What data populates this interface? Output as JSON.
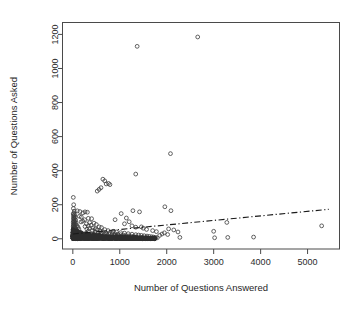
{
  "chart_data": {
    "type": "scatter",
    "title": "",
    "xlabel": "Number of Questions Answered",
    "ylabel": "Number of Questions Asked",
    "xlim": [
      -220,
      5680
    ],
    "ylim": [
      -60,
      1270
    ],
    "xticks": [
      0,
      1000,
      2000,
      3000,
      4000,
      5000
    ],
    "yticks": [
      0,
      200,
      400,
      600,
      800,
      1000,
      1200
    ],
    "xtick_labels": [
      "0",
      "1000",
      "2000",
      "3000",
      "4000",
      "5000"
    ],
    "ytick_labels": [
      "0",
      "200",
      "400",
      "600",
      "800",
      "1000",
      "1200"
    ],
    "grid": false,
    "legend": null,
    "marker": "open-circle",
    "point_color": "#3b3b3b",
    "line_color": "#1a1a1a",
    "box_color": "#4a4a4a",
    "background": "#ffffff",
    "series": [
      {
        "name": "users",
        "points": [
          [
            10,
            243
          ],
          [
            18,
            200
          ],
          [
            12,
            178
          ],
          [
            30,
            162
          ],
          [
            22,
            150
          ],
          [
            8,
            146
          ],
          [
            40,
            141
          ],
          [
            15,
            136
          ],
          [
            26,
            130
          ],
          [
            52,
            126
          ],
          [
            12,
            122
          ],
          [
            35,
            118
          ],
          [
            20,
            114
          ],
          [
            60,
            110
          ],
          [
            14,
            106
          ],
          [
            28,
            102
          ],
          [
            45,
            99
          ],
          [
            10,
            96
          ],
          [
            70,
            93
          ],
          [
            18,
            90
          ],
          [
            33,
            87
          ],
          [
            55,
            84
          ],
          [
            12,
            82
          ],
          [
            25,
            79
          ],
          [
            90,
            77
          ],
          [
            16,
            75
          ],
          [
            42,
            72
          ],
          [
            8,
            70
          ],
          [
            110,
            68
          ],
          [
            30,
            66
          ],
          [
            62,
            64
          ],
          [
            14,
            62
          ],
          [
            38,
            60
          ],
          [
            20,
            58
          ],
          [
            130,
            57
          ],
          [
            10,
            55
          ],
          [
            48,
            54
          ],
          [
            24,
            52
          ],
          [
            75,
            51
          ],
          [
            16,
            50
          ],
          [
            36,
            48
          ],
          [
            12,
            47
          ],
          [
            95,
            46
          ],
          [
            28,
            45
          ],
          [
            58,
            44
          ],
          [
            18,
            43
          ],
          [
            44,
            42
          ],
          [
            10,
            41
          ],
          [
            140,
            40
          ],
          [
            32,
            39
          ],
          [
            68,
            38
          ],
          [
            22,
            37
          ],
          [
            50,
            36
          ],
          [
            14,
            35
          ],
          [
            115,
            34
          ],
          [
            26,
            34
          ],
          [
            80,
            33
          ],
          [
            16,
            32
          ],
          [
            40,
            31
          ],
          [
            12,
            31
          ],
          [
            160,
            30
          ],
          [
            30,
            29
          ],
          [
            60,
            29
          ],
          [
            20,
            28
          ],
          [
            100,
            27
          ],
          [
            14,
            27
          ],
          [
            46,
            26
          ],
          [
            24,
            26
          ],
          [
            130,
            25
          ],
          [
            18,
            25
          ],
          [
            70,
            24
          ],
          [
            34,
            24
          ],
          [
            10,
            23
          ],
          [
            190,
            23
          ],
          [
            52,
            22
          ],
          [
            28,
            22
          ],
          [
            88,
            21
          ],
          [
            16,
            21
          ],
          [
            42,
            20
          ],
          [
            22,
            20
          ],
          [
            150,
            19
          ],
          [
            12,
            19
          ],
          [
            64,
            18
          ],
          [
            32,
            18
          ],
          [
            105,
            17
          ],
          [
            18,
            17
          ],
          [
            48,
            16
          ],
          [
            26,
            16
          ],
          [
            220,
            15
          ],
          [
            14,
            15
          ],
          [
            76,
            14
          ],
          [
            36,
            14
          ],
          [
            120,
            13
          ],
          [
            20,
            13
          ],
          [
            56,
            12
          ],
          [
            30,
            12
          ],
          [
            170,
            11
          ],
          [
            16,
            11
          ],
          [
            92,
            10
          ],
          [
            40,
            10
          ],
          [
            250,
            9
          ],
          [
            24,
            9
          ],
          [
            68,
            8
          ],
          [
            34,
            8
          ],
          [
            140,
            7
          ],
          [
            18,
            7
          ],
          [
            84,
            6
          ],
          [
            44,
            6
          ],
          [
            200,
            5
          ],
          [
            22,
            5
          ],
          [
            110,
            4
          ],
          [
            52,
            4
          ],
          [
            300,
            3
          ],
          [
            28,
            3
          ],
          [
            72,
            2
          ],
          [
            38,
            2
          ],
          [
            160,
            1
          ],
          [
            12,
            1
          ],
          [
            96,
            0
          ],
          [
            48,
            0
          ],
          [
            260,
            158
          ],
          [
            150,
            160
          ],
          [
            215,
            152
          ],
          [
            310,
            156
          ],
          [
            95,
            164
          ],
          [
            330,
            120
          ],
          [
            180,
            128
          ],
          [
            250,
            112
          ],
          [
            400,
            118
          ],
          [
            140,
            132
          ],
          [
            360,
            95
          ],
          [
            210,
            104
          ],
          [
            290,
            88
          ],
          [
            450,
            92
          ],
          [
            175,
            99
          ],
          [
            500,
            84
          ],
          [
            330,
            76
          ],
          [
            390,
            80
          ],
          [
            260,
            72
          ],
          [
            560,
            70
          ],
          [
            430,
            64
          ],
          [
            610,
            66
          ],
          [
            350,
            60
          ],
          [
            480,
            58
          ],
          [
            300,
            56
          ],
          [
            680,
            54
          ],
          [
            520,
            52
          ],
          [
            420,
            50
          ],
          [
            750,
            48
          ],
          [
            580,
            46
          ],
          [
            330,
            45
          ],
          [
            860,
            44
          ],
          [
            640,
            42
          ],
          [
            470,
            41
          ],
          [
            930,
            40
          ],
          [
            700,
            38
          ],
          [
            540,
            37
          ],
          [
            1020,
            36
          ],
          [
            780,
            35
          ],
          [
            610,
            34
          ],
          [
            1100,
            33
          ],
          [
            840,
            32
          ],
          [
            670,
            31
          ],
          [
            1180,
            30
          ],
          [
            900,
            29
          ],
          [
            720,
            28
          ],
          [
            1260,
            27
          ],
          [
            960,
            26
          ],
          [
            780,
            25
          ],
          [
            1340,
            24
          ],
          [
            1020,
            24
          ],
          [
            830,
            23
          ],
          [
            1400,
            22
          ],
          [
            1080,
            21
          ],
          [
            880,
            21
          ],
          [
            1460,
            20
          ],
          [
            1140,
            19
          ],
          [
            930,
            19
          ],
          [
            1520,
            18
          ],
          [
            1200,
            17
          ],
          [
            980,
            17
          ],
          [
            1580,
            16
          ],
          [
            1250,
            15
          ],
          [
            1030,
            15
          ],
          [
            1630,
            14
          ],
          [
            1300,
            13
          ],
          [
            1080,
            13
          ],
          [
            1680,
            12
          ],
          [
            1350,
            11
          ],
          [
            1130,
            11
          ],
          [
            1720,
            10
          ],
          [
            1400,
            9
          ],
          [
            1180,
            9
          ],
          [
            1760,
            8
          ],
          [
            1450,
            7
          ],
          [
            1230,
            7
          ],
          [
            1800,
            6
          ],
          [
            1500,
            5
          ],
          [
            1280,
            5
          ],
          [
            1560,
            4
          ],
          [
            1330,
            3
          ],
          [
            1620,
            2
          ],
          [
            1380,
            2
          ],
          [
            1680,
            1
          ],
          [
            1430,
            1
          ],
          [
            1740,
            0
          ],
          [
            1480,
            0
          ],
          [
            1540,
            0
          ],
          [
            1600,
            0
          ],
          [
            1660,
            0
          ],
          [
            520,
            280
          ],
          [
            640,
            350
          ],
          [
            680,
            340
          ],
          [
            710,
            322
          ],
          [
            760,
            325
          ],
          [
            790,
            318
          ],
          [
            600,
            300
          ],
          [
            560,
            290
          ],
          [
            1340,
            380
          ],
          [
            1370,
            1130
          ],
          [
            2660,
            1185
          ],
          [
            2080,
            500
          ],
          [
            1280,
            165
          ],
          [
            1420,
            158
          ],
          [
            1140,
            122
          ],
          [
            900,
            112
          ],
          [
            1030,
            148
          ],
          [
            1200,
            100
          ],
          [
            1460,
            70
          ],
          [
            1340,
            68
          ],
          [
            1260,
            76
          ],
          [
            1500,
            62
          ],
          [
            1570,
            55
          ],
          [
            1100,
            88
          ],
          [
            1960,
            188
          ],
          [
            2090,
            165
          ],
          [
            2040,
            58
          ],
          [
            1950,
            35
          ],
          [
            1900,
            28
          ],
          [
            2150,
            52
          ],
          [
            2280,
            8
          ],
          [
            1850,
            20
          ],
          [
            2020,
            25
          ],
          [
            1780,
            42
          ],
          [
            1700,
            48
          ],
          [
            2240,
            40
          ],
          [
            3000,
            44
          ],
          [
            3020,
            6
          ],
          [
            3300,
            8
          ],
          [
            3280,
            96
          ],
          [
            3850,
            10
          ],
          [
            5300,
            76
          ]
        ]
      }
    ],
    "fit_line": {
      "style": "dashdot",
      "x_start": 0,
      "y_start": 28,
      "x_end": 5450,
      "y_end": 173
    }
  }
}
